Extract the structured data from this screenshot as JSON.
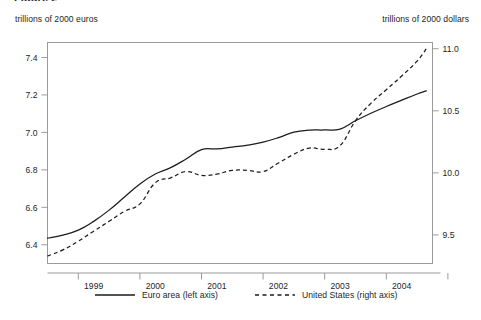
{
  "figure": {
    "cut_off_title": "Figure 2",
    "left_axis_caption": "trillions of 2000 euros",
    "right_axis_caption": "trillions of 2000 dollars"
  },
  "chart_data": {
    "type": "line",
    "title": "",
    "subtitle": "",
    "xlabel": "",
    "ylabel": "trillions of 2000 euros",
    "y2label": "trillions of 2000 dollars",
    "grid": false,
    "legend_position": "bottom",
    "xlim": [
      1998.25,
      2004.5
    ],
    "ylim": [
      6.3,
      7.48
    ],
    "y2lim": [
      9.27,
      11.05
    ],
    "xticks": [
      1999,
      2000,
      2001,
      2002,
      2003,
      2004
    ],
    "xtick_labels": [
      "1999",
      "2000",
      "2001",
      "2002",
      "2003",
      "2004"
    ],
    "yticks": [
      6.4,
      6.6,
      6.8,
      7.0,
      7.2,
      7.4
    ],
    "ytick_labels": [
      "6.4",
      "6.6",
      "6.8",
      "7.0",
      "7.2",
      "7.4"
    ],
    "y2ticks": [
      9.5,
      10.0,
      10.5,
      11.0
    ],
    "y2tick_labels": [
      "9.5",
      "10.0",
      "10.5",
      "11.0"
    ],
    "x": [
      1998.25,
      1998.5,
      1998.75,
      1999.0,
      1999.25,
      1999.5,
      1999.75,
      2000.0,
      2000.25,
      2000.5,
      2000.75,
      2001.0,
      2001.25,
      2001.5,
      2001.75,
      2002.0,
      2002.25,
      2002.5,
      2002.75,
      2003.0,
      2003.25,
      2003.5,
      2003.75,
      2004.0,
      2004.25,
      2004.4
    ],
    "series": [
      {
        "name": "Euro area (left axis)",
        "axis": "left",
        "style": "solid",
        "values": [
          6.435,
          6.452,
          6.478,
          6.525,
          6.585,
          6.655,
          6.725,
          6.778,
          6.812,
          6.858,
          6.908,
          6.912,
          6.922,
          6.932,
          6.948,
          6.972,
          7.001,
          7.012,
          7.013,
          7.018,
          7.062,
          7.102,
          7.138,
          7.172,
          7.205,
          7.222
        ]
      },
      {
        "name": "United States (right axis)",
        "axis": "right",
        "style": "dashed",
        "values": [
          9.33,
          9.38,
          9.45,
          9.53,
          9.61,
          9.69,
          9.75,
          9.92,
          9.96,
          10.01,
          9.98,
          9.99,
          10.02,
          10.02,
          10.01,
          10.08,
          10.15,
          10.2,
          10.19,
          10.22,
          10.42,
          10.56,
          10.67,
          10.78,
          10.9,
          11.0
        ]
      }
    ]
  },
  "legend": {
    "entries": [
      {
        "label": "Euro area (left axis)",
        "style": "solid"
      },
      {
        "label": "United States (right axis)",
        "style": "dashed"
      }
    ]
  }
}
